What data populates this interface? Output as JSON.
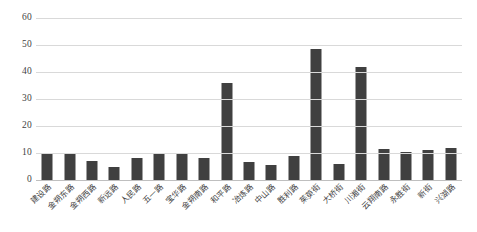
{
  "chart_data": {
    "type": "bar",
    "title": "",
    "subtitle": "",
    "xlabel": "",
    "ylabel": "",
    "ylim": [
      0,
      60
    ],
    "yticks": [
      0,
      10,
      20,
      30,
      40,
      50,
      60
    ],
    "grid": true,
    "legend": false,
    "legend_position": "none",
    "bar_color": "#404040",
    "gridline_color": "#d9d9d9",
    "axis_text_color": "#3f3f3f",
    "categories": [
      "建设路",
      "金朔东路",
      "金朔西路",
      "新远路",
      "人民路",
      "五一路",
      "宝华路",
      "金朔南路",
      "和平路",
      "冶炼路",
      "中山路",
      "胜利路",
      "茱萸街",
      "大桥街",
      "川湘街",
      "云翔南路",
      "永胜街",
      "新街",
      "兴湖路"
    ],
    "values": [
      10,
      9.5,
      7,
      5,
      8,
      10,
      10,
      8,
      36,
      6.5,
      5.5,
      9,
      48.5,
      6,
      42,
      11.5,
      10.5,
      11,
      12
    ]
  }
}
